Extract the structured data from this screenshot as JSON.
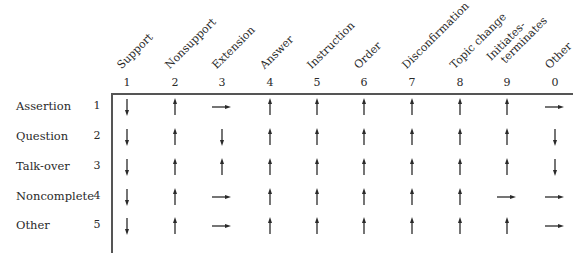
{
  "columns": [
    {
      "num": "1",
      "label": "Support"
    },
    {
      "num": "2",
      "label": "Nonsupport"
    },
    {
      "num": "3",
      "label": "Extension"
    },
    {
      "num": "4",
      "label": "Answer"
    },
    {
      "num": "5",
      "label": "Instruction"
    },
    {
      "num": "6",
      "label": "Order"
    },
    {
      "num": "7",
      "label": "Disconfirmation"
    },
    {
      "num": "8",
      "label": "Topic change"
    },
    {
      "num": "9",
      "label": "Initiates-\nterminates",
      "line1": "Initiates-",
      "line2": "terminates"
    },
    {
      "num": "0",
      "label": "Other"
    }
  ],
  "rows": [
    {
      "num": "1",
      "label": "Assertion",
      "arrows": [
        "down",
        "up",
        "right",
        "up",
        "up",
        "up",
        "up",
        "up",
        "up",
        "right"
      ]
    },
    {
      "num": "2",
      "label": "Question",
      "arrows": [
        "down",
        "up",
        "down",
        "up",
        "up",
        "up",
        "up",
        "up",
        "up",
        "down"
      ]
    },
    {
      "num": "3",
      "label": "Talk-over",
      "arrows": [
        "down",
        "up",
        "up",
        "up",
        "up",
        "up",
        "up",
        "up",
        "up",
        "down"
      ]
    },
    {
      "num": "4",
      "label": "Noncomplete",
      "arrows": [
        "down",
        "up",
        "right",
        "up",
        "up",
        "up",
        "up",
        "up",
        "right",
        "right"
      ]
    },
    {
      "num": "5",
      "label": "Other",
      "arrows": [
        "down",
        "up",
        "right",
        "up",
        "up",
        "up",
        "up",
        "up",
        "up",
        "right"
      ]
    }
  ],
  "icons": {
    "up": "arrow-up-icon",
    "down": "arrow-down-icon",
    "right": "arrow-right-icon"
  },
  "colors": {
    "ink": "#2a2a2a",
    "rule": "#555555"
  }
}
